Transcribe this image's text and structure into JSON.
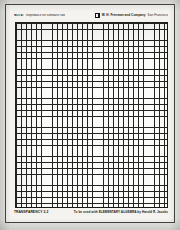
{
  "document": {
    "kind": "overhead-projector transparency master",
    "page_background": "#f4f3f0",
    "ink_color": "#20201c",
    "scan_background": "#e9e9e7"
  },
  "header": {
    "left_label": "NOTE:",
    "left_text": "Reproduce on software rate",
    "publisher_mark_name": "publisher-colophon",
    "right_text": "W. H. Freeman and Company",
    "right_city": "San Francisco"
  },
  "grid": {
    "columns": 30,
    "rows": 32,
    "cell_width_px": 5.1,
    "cell_height_px": 5.8,
    "line_color": "#23231f",
    "line_weight_px": 0.85,
    "border_color": "#171713",
    "heavy_gridlines": false
  },
  "footer": {
    "left_text": "TRANSPARENCY 2-2",
    "right_text": "To be used with ELEMENTARY ALGEBRA by Harold R. Jacobs"
  },
  "chart_data": {
    "type": "table",
    "xlabel": "",
    "ylabel": "",
    "columns": 30,
    "rows": 32,
    "values": [],
    "grid": true,
    "legend": "none"
  }
}
